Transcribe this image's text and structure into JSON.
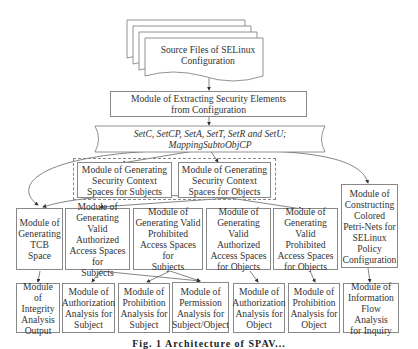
{
  "diagram": {
    "source": {
      "label": "Source Files of SELinux Configuration",
      "line1": "Source Files of SELinux",
      "line2": "Configuration"
    },
    "extract": {
      "line1": "Module of Extracting Security Elements",
      "line2": "from Configuration"
    },
    "sets": {
      "line1": "SetC, SetCP, SetA, SetT, SetR and SetU;",
      "line2": "MappingSubtoObjCP"
    },
    "context_subjects": {
      "l1": "Module of Generating",
      "l2": "Security Context",
      "l3": "Spaces for Subjects"
    },
    "context_objects": {
      "l1": "Module of Generating",
      "l2": "Security Context",
      "l3": "Spaces for Objects"
    },
    "row3": [
      {
        "l1": "Module of",
        "l2": "Generating",
        "l3": "TCB Space"
      },
      {
        "l1": "Module of",
        "l2": "Generating Valid",
        "l3": "Authorized",
        "l4": "Access Spaces for",
        "l5": "Subjects"
      },
      {
        "l1": "Module of",
        "l2": "Generating Valid",
        "l3": "Prohibited",
        "l4": "Access Spaces for",
        "l5": "Subjects"
      },
      {
        "l1": "Module of",
        "l2": "Generating Valid",
        "l3": "Authorized",
        "l4": "Access Spaces",
        "l5": "for Objects"
      },
      {
        "l1": "Module of",
        "l2": "Generating Valid",
        "l3": "Prohibited",
        "l4": "Access Spaces",
        "l5": "for Objects"
      }
    ],
    "petri": {
      "l1": "Module of",
      "l2": "Constructing",
      "l3": "Colored",
      "l4": "Petri-Nets for",
      "l5": "SELinux",
      "l6": "Policy",
      "l7": "Configuration"
    },
    "row4": [
      {
        "l1": "Module of",
        "l2": "Integrity",
        "l3": "Analysis",
        "l4": "Output"
      },
      {
        "l1": "Module of",
        "l2": "Authorization",
        "l3": "Analysis for",
        "l4": "Subject"
      },
      {
        "l1": "Module of",
        "l2": "Prohibition",
        "l3": "Analysis for",
        "l4": "Subject"
      },
      {
        "l1": "Module of",
        "l2": "Permission",
        "l3": "Analysis for",
        "l4": "Subject/Object"
      },
      {
        "l1": "Module of",
        "l2": "Authorization",
        "l3": "Analysis for",
        "l4": "Object"
      },
      {
        "l1": "Module of",
        "l2": "Prohibition",
        "l3": "Analysis for",
        "l4": "Object"
      },
      {
        "l1": "Module of",
        "l2": "Information",
        "l3": "Flow Analysis",
        "l4": "for Inquiry"
      }
    ],
    "caption": "Fig. 1 Architecture of SPAV..."
  }
}
